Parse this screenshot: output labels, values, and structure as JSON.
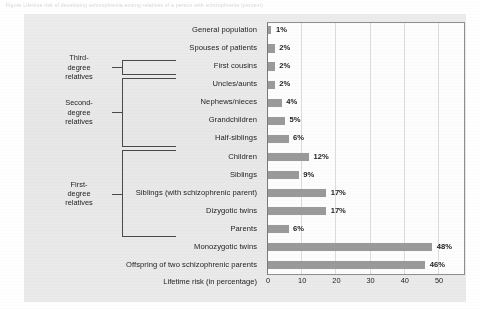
{
  "figure": {
    "caption_top": "Figure  Lifetime risk of developing schizophrenia among relatives of a person with schizophrenia (percent)",
    "axis_title": "Lifetime risk (in percentage)",
    "bar_color": "#9a9a9a",
    "panel_color": "#e9e9e9",
    "plot_bg": "#fdfdfd"
  },
  "groups": [
    {
      "name": "third-degree",
      "label_lines": [
        "Third-",
        "degree",
        "relatives"
      ]
    },
    {
      "name": "second-degree",
      "label_lines": [
        "Second-",
        "degree",
        "relatives"
      ]
    },
    {
      "name": "first-degree",
      "label_lines": [
        "First-",
        "degree",
        "relatives"
      ]
    }
  ],
  "chart_data": {
    "type": "bar",
    "title": "",
    "orientation": "horizontal",
    "xlabel": "Lifetime risk (in percentage)",
    "ylabel": "",
    "xlim": [
      0,
      57
    ],
    "xticks": [
      0,
      10,
      20,
      30,
      40,
      50
    ],
    "grid": true,
    "legend": "none",
    "categories": [
      "General population",
      "Spouses of patients",
      "First cousins",
      "Uncles/aunts",
      "Nephews/nieces",
      "Grandchildren",
      "Half-siblings",
      "Children",
      "Siblings",
      "Siblings (with schizophrenic parent)",
      "Dizygotic twins",
      "Parents",
      "Monozygotic twins",
      "Offspring of two schizophrenic parents"
    ],
    "values": [
      1,
      2,
      2,
      2,
      4,
      5,
      6,
      12,
      9,
      17,
      17,
      6,
      48,
      46
    ],
    "value_labels": [
      "1%",
      "2%",
      "2%",
      "2%",
      "4%",
      "5%",
      "6%",
      "12%",
      "9%",
      "17%",
      "17%",
      "6%",
      "48%",
      "46%"
    ]
  }
}
